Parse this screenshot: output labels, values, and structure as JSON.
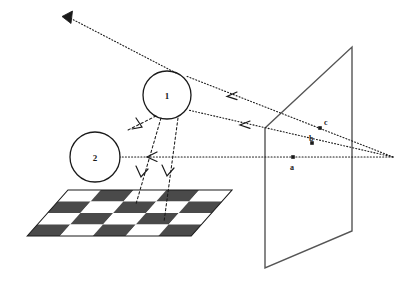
{
  "figure": {
    "background_color": "#ffffff",
    "line_color": "#1a1a1a",
    "checker_dark_color": "#4a4a4a",
    "checker_light_color": "#ffffff",
    "width": 406,
    "height": 282
  },
  "spheres": [
    {
      "id": "sphere-1",
      "label": "1",
      "cx": 167,
      "cy": 95,
      "r": 24
    },
    {
      "id": "sphere-2",
      "label": "2",
      "cx": 95,
      "cy": 157,
      "r": 25
    }
  ],
  "screen": {
    "name": "image-plane",
    "points": "265,128 352,47 352,231 265,268"
  },
  "floor": {
    "name": "checkerboard-floor",
    "points": "28,236 68,190 232,190 193,236",
    "rows": 4,
    "cols": 5
  },
  "view_point": {
    "name": "eye-point",
    "x": 393,
    "y": 157
  },
  "screen_points": [
    {
      "label": "c",
      "x": 320,
      "y": 128,
      "label_x": 325,
      "label_y": 124
    },
    {
      "label": "b",
      "x": 312,
      "y": 143,
      "label_x": 314,
      "label_y": 142
    },
    {
      "label": "a",
      "x": 293,
      "y": 158,
      "label_x": 296,
      "label_y": 170
    }
  ],
  "view_rays": [
    {
      "name": "view-ray-c",
      "from": "393,157",
      "to": "186,76",
      "arrow_at": "232,95"
    },
    {
      "name": "view-ray-b",
      "from": "393,157",
      "to": "188,110",
      "arrow_at": "245,124"
    },
    {
      "name": "view-ray-a",
      "from": "393,157",
      "to": "120,157",
      "arrow_at": "152,157"
    }
  ],
  "reflected_ray": {
    "name": "reflected-ray-upper-left",
    "from": "172,71",
    "to": "64,15",
    "arrow_at": "68,17"
  },
  "shadow_rays": [
    {
      "name": "shadow-ray-1a",
      "from": "160,119",
      "to": "136,200",
      "arrow_at": "139,190"
    },
    {
      "name": "shadow-ray-1b",
      "from": "176,119",
      "to": "163,200",
      "arrow_at": "165,190"
    },
    {
      "name": "shadow-ray-1c",
      "from": "155,118",
      "to": "131,128",
      "arrow_at": "134,127"
    }
  ],
  "legend_notes": {
    "sphere_one": "1",
    "sphere_two": "2",
    "point_a": "a",
    "point_b": "b",
    "point_c": "c"
  }
}
